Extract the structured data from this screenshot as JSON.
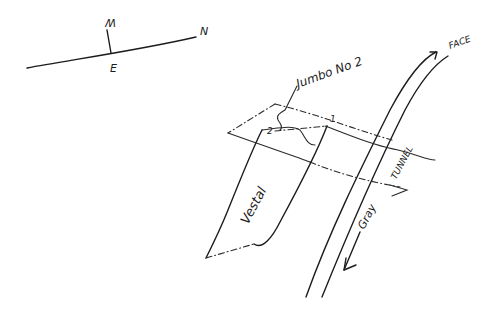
{
  "compass": {
    "west_label": "W",
    "east_label": "E",
    "north_label": "N"
  },
  "labels": {
    "jumbo": "Jumbo No 2",
    "point_1": "1",
    "point_2": "2",
    "face": "FACE",
    "tunnel": "TUNNEL",
    "gray": "Gray",
    "vestal": "Vestal"
  },
  "colors": {
    "ink": "#1c1c1c",
    "paper": "#ffffff"
  }
}
